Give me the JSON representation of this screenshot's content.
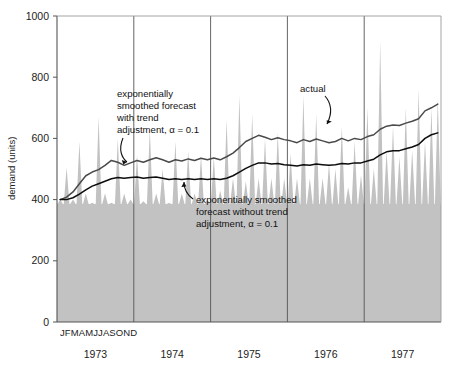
{
  "chart_data": {
    "type": "area",
    "title": "",
    "subtitle": "",
    "xlabel": "",
    "ylabel": "demand (units)",
    "ylim": [
      0,
      1000
    ],
    "yticks": [
      0,
      200,
      400,
      600,
      800,
      1000
    ],
    "ytick_labels": [
      "0",
      "200",
      "400",
      "600",
      "800",
      "1000"
    ],
    "grid": false,
    "legend_position": "none",
    "x_month_letters": "JFMAMJJASOND",
    "x_years": [
      "1973",
      "1974",
      "1975",
      "1976",
      "1977"
    ],
    "x_months": [
      "J",
      "F",
      "M",
      "A",
      "M",
      "J",
      "J",
      "A",
      "S",
      "O",
      "N",
      "D"
    ],
    "annotations": [
      {
        "name": "forecast-with-trend",
        "text": "exponentially smoothed forecast with trend adjustment, α = 0.1",
        "lines": [
          "exponentially",
          "smoothed forecast",
          "with trend",
          "adjustment, α = 0.1"
        ],
        "points_to_series": "forecast_with_trend"
      },
      {
        "name": "forecast-without-trend",
        "text": "exponentially smoothed forecast without trend adjustment, α = 0.1",
        "lines": [
          "exponentially smoothed",
          "forecast without trend",
          "adjustment, α = 0.1"
        ],
        "points_to_series": "forecast_without_trend"
      },
      {
        "name": "actual",
        "text": "actual",
        "lines": [
          "actual"
        ],
        "points_to_series": "actual"
      }
    ],
    "colors": {
      "actual_fill": "#c2c2c2",
      "forecast_with_trend_line": "#4a4a4a",
      "forecast_without_trend_line": "#0d0d0d",
      "axis": "#555555",
      "year_divider": "#555555",
      "background": "#ffffff"
    },
    "series": [
      {
        "name": "actual",
        "label": "actual",
        "style": "area",
        "values": [
          400,
          505,
          400,
          590,
          420,
          390,
          670,
          420,
          390,
          600,
          420,
          400,
          545,
          395,
          630,
          420,
          500,
          390,
          590,
          420,
          560,
          420,
          545,
          400,
          540,
          430,
          660,
          470,
          740,
          460,
          680,
          470,
          600,
          470,
          620,
          470,
          550,
          470,
          740,
          470,
          680,
          470,
          520,
          500,
          640,
          440,
          590,
          480,
          700,
          500,
          920,
          560,
          640,
          540,
          700,
          560,
          760,
          590,
          700,
          730
        ]
      },
      {
        "name": "forecast_with_trend",
        "label": "exponentially smoothed forecast with trend adjustment, α = 0.1",
        "style": "line",
        "values": [
          400,
          408,
          425,
          452,
          478,
          490,
          498,
          512,
          528,
          522,
          512,
          520,
          528,
          522,
          530,
          537,
          530,
          522,
          530,
          526,
          533,
          528,
          535,
          530,
          536,
          530,
          540,
          552,
          570,
          590,
          600,
          610,
          604,
          596,
          602,
          596,
          592,
          586,
          596,
          590,
          598,
          592,
          586,
          590,
          600,
          592,
          600,
          596,
          606,
          612,
          630,
          640,
          644,
          642,
          650,
          656,
          664,
          690,
          700,
          712
        ]
      },
      {
        "name": "forecast_without_trend",
        "label": "exponentially smoothed forecast without trend adjustment, α = 0.1",
        "style": "line",
        "values": [
          400,
          400,
          406,
          418,
          432,
          444,
          452,
          460,
          468,
          472,
          470,
          472,
          474,
          470,
          472,
          474,
          470,
          466,
          468,
          466,
          468,
          466,
          468,
          466,
          468,
          466,
          470,
          478,
          490,
          502,
          512,
          520,
          520,
          516,
          518,
          514,
          512,
          510,
          514,
          512,
          516,
          514,
          512,
          514,
          518,
          516,
          520,
          520,
          526,
          532,
          546,
          556,
          560,
          560,
          566,
          572,
          580,
          600,
          612,
          618
        ]
      }
    ]
  }
}
